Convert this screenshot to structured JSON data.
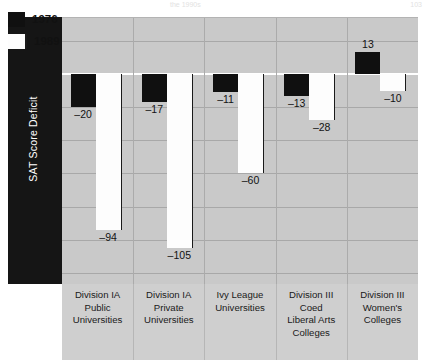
{
  "page": {
    "header_faint": "the 1990s",
    "page_number": "103"
  },
  "legend": {
    "position": "top-left-inside",
    "items": [
      {
        "label": "1976",
        "color": "#101010",
        "name": "legend-1976"
      },
      {
        "label": "1989",
        "color": "#fdfdfd",
        "name": "legend-1989"
      }
    ]
  },
  "axis": {
    "ylabel": "SAT Score Deficit",
    "yticks": [
      "20",
      "0",
      "-20",
      "-40",
      "-60",
      "-80",
      "-100",
      "-120"
    ],
    "ytick_values": [
      20,
      0,
      -20,
      -40,
      -60,
      -80,
      -100,
      -120
    ]
  },
  "chart_data": {
    "type": "bar",
    "title": "",
    "subtitle": "",
    "xlabel": "",
    "ylabel": "SAT Score Deficit",
    "ylim": [
      -130,
      28
    ],
    "grid": true,
    "legend_position": "top-left-inside",
    "categories": [
      "Division IA Public Universities",
      "Division IA Private Universities",
      "Ivy League Universities",
      "Division III Coed Liberal Arts Colleges",
      "Division III Women's Colleges"
    ],
    "category_lines": [
      [
        "Division IA",
        "Public",
        "Universities"
      ],
      [
        "Division IA",
        "Private",
        "Universities"
      ],
      [
        "Ivy League",
        "Universities"
      ],
      [
        "Division III",
        "Coed",
        "Liberal Arts",
        "Colleges"
      ],
      [
        "Division III",
        "Women's",
        "Colleges"
      ]
    ],
    "series": [
      {
        "name": "1976",
        "color": "#101010",
        "values": [
          -20,
          -17,
          -11,
          -13,
          13
        ],
        "labels": [
          "-20",
          "-17",
          "-11",
          "-13",
          "13"
        ]
      },
      {
        "name": "1989",
        "color": "#fdfdfd",
        "values": [
          -94,
          -105,
          -60,
          -28,
          -10
        ],
        "labels": [
          "-94",
          "-105",
          "-60",
          "-28",
          "-10"
        ]
      }
    ]
  },
  "colors": {
    "plot_background": "#c9c9c9",
    "label_background": "#cfcfcf",
    "axis_strip": "#151515",
    "gridline": "#a8a8a8",
    "zeroline": "#ffffff",
    "bar_1976": "#101010",
    "bar_1989": "#fdfdfd"
  }
}
